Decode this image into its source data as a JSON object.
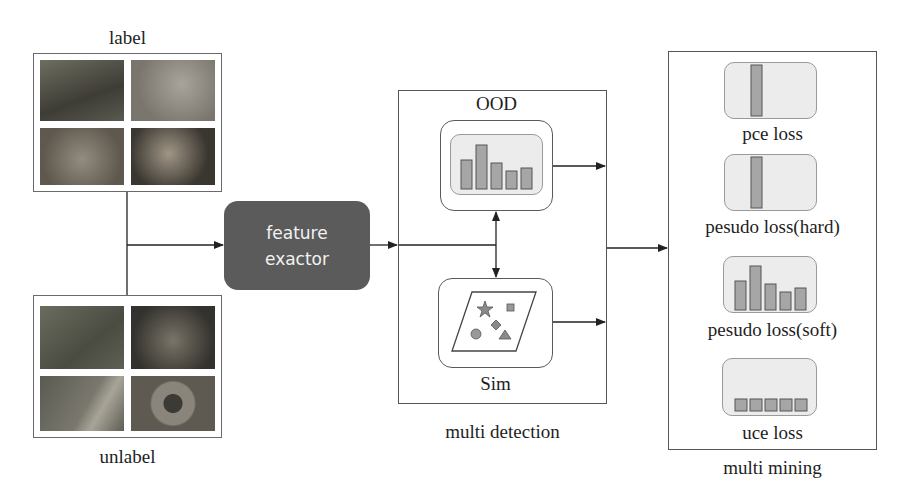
{
  "inputs": {
    "labeled": {
      "caption": "label",
      "thumbnails": [
        {
          "name": "deer",
          "color": "#5a5a50"
        },
        {
          "name": "blurred-animal",
          "color": "#8a857e"
        },
        {
          "name": "cat",
          "color": "#7a756c"
        },
        {
          "name": "dog",
          "color": "#6a6258"
        }
      ]
    },
    "unlabeled": {
      "caption": "unlabel",
      "thumbnails": [
        {
          "name": "bird",
          "color": "#5c5e52"
        },
        {
          "name": "leopard",
          "color": "#4e4c46"
        },
        {
          "name": "butterfly",
          "color": "#6e6c64"
        },
        {
          "name": "round-animal",
          "color": "#7e7a72"
        }
      ]
    }
  },
  "feature_extractor": {
    "line1": "feature",
    "line2": "exactor",
    "fill": "#5b5b5b"
  },
  "multi_detection": {
    "caption": "multi detection",
    "ood": {
      "label": "OOD",
      "bars": [
        0.6,
        1.0,
        0.5,
        0.3,
        0.38
      ]
    },
    "sim": {
      "label": "Sim",
      "shapes": [
        "star",
        "square",
        "diamond",
        "circle",
        "triangle"
      ]
    }
  },
  "multi_mining": {
    "caption": "multi mining",
    "losses": [
      {
        "label": "pce loss",
        "type": "single-bar"
      },
      {
        "label": "pesudo loss(hard)",
        "type": "single-bar"
      },
      {
        "label": "pesudo loss(soft)",
        "type": "distribution",
        "bars": [
          0.6,
          1.0,
          0.6,
          0.38,
          0.48
        ]
      },
      {
        "label": "uce loss",
        "type": "uniform",
        "bars": [
          0.2,
          0.2,
          0.2,
          0.2,
          0.2
        ]
      }
    ]
  },
  "colors": {
    "bar_fill": "#a6a6a6",
    "bar_stroke": "#555555",
    "panel_inner": "#ececec",
    "line": "#222222"
  }
}
